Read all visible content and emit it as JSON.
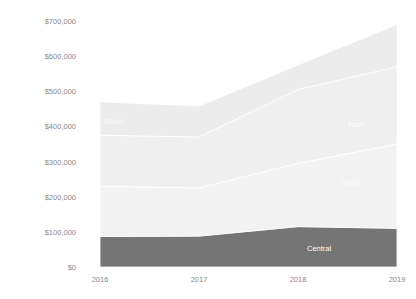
{
  "chart_data": {
    "type": "area",
    "stacked": true,
    "title": "",
    "xlabel": "",
    "ylabel": "",
    "categories": [
      "2016",
      "2017",
      "2018",
      "2019"
    ],
    "series": [
      {
        "name": "Central",
        "color": "#757575",
        "values": [
          87000,
          88000,
          115000,
          110000
        ]
      },
      {
        "name": "West",
        "color": "#f2f2f2",
        "values": [
          143000,
          137000,
          180000,
          240000
        ]
      },
      {
        "name": "East",
        "color": "#efefef",
        "values": [
          145000,
          145000,
          210000,
          220000
        ]
      },
      {
        "name": "South",
        "color": "#ececec",
        "values": [
          95000,
          88000,
          70000,
          120000
        ]
      }
    ],
    "ylim": [
      0,
      700000
    ],
    "yticks": [
      "$0",
      "$100,000",
      "$200,000",
      "$300,000",
      "$400,000",
      "$500,000",
      "$600,000",
      "$700,000"
    ],
    "grid": false,
    "band_labels": [
      {
        "series": "South",
        "text": "South",
        "x": 104,
        "y": 124
      },
      {
        "series": "East",
        "text": "East",
        "x": 348,
        "y": 127
      },
      {
        "series": "West",
        "text": "West",
        "x": 342,
        "y": 185
      },
      {
        "series": "Central",
        "text": "Central",
        "x": 307,
        "y": 251
      }
    ],
    "legend_position": "bottom"
  },
  "legend": {
    "items": [
      "",
      ""
    ]
  }
}
